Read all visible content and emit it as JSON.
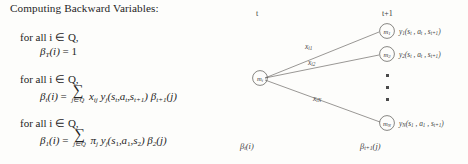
{
  "document": {
    "heading": "Computing Backward Variables:",
    "blocks": [
      {
        "quantifier": "for all i ∈ Q,",
        "equation_plain": "β_T(i) = 1",
        "lhs_beta": "β",
        "lhs_sub": "T",
        "lhs_arg": "(i)",
        "relation": "=",
        "rhs": "1",
        "has_sum": false
      },
      {
        "quantifier": "for all i ∈ Q,",
        "equation_plain": "β_t(i) = ∑_{j∈Q} x_ij y_j(s_t, a_t, s_{t+1}) β_{t+1}(j)",
        "lhs_beta": "β",
        "lhs_sub": "t",
        "lhs_arg": "(i)",
        "relation": "=",
        "has_sum": true,
        "sum_symbol": "∑",
        "sum_limit": "j∈Q",
        "transition_term": "x",
        "transition_sub": "ij",
        "emission_term": "y",
        "emission_sub": "j",
        "emission_args": "(s_t, a_t, s_{t+1})",
        "beta_term": "β",
        "beta_sub": "t+1",
        "beta_arg": "(j)"
      },
      {
        "quantifier": "for all i ∈ Q,",
        "equation_plain": "β_1(i) = ∑_{j∈Q} π_j y_j(s_1, a_1, s_2) β_2(j)",
        "lhs_beta": "β",
        "lhs_sub": "1",
        "lhs_arg": "(i)",
        "relation": "=",
        "has_sum": true,
        "sum_symbol": "∑",
        "sum_limit": "j∈Q",
        "transition_term": "π",
        "transition_sub": "j",
        "emission_term": "y",
        "emission_sub": "j",
        "emission_args": "(s_1, a_1, s_2)",
        "beta_term": "β",
        "beta_sub": "2",
        "beta_arg": "(j)"
      }
    ]
  },
  "diagram": {
    "time_labels": {
      "left": "t",
      "right": "t+1"
    },
    "source_node": {
      "label": "m",
      "sub": "i"
    },
    "target_nodes": [
      {
        "label": "m",
        "sub": "1",
        "emission": "y",
        "emission_sub": "1",
        "emission_args": "(s",
        "emission_args_full": "y₁(sₜ , aₜ , sₜ₊₁)"
      },
      {
        "label": "m",
        "sub": "2",
        "emission": "y",
        "emission_sub": "2",
        "emission_args_full": "y₂(sₜ , aₜ , sₜ₊₁)"
      },
      {
        "label": "m",
        "sub": "N",
        "emission": "y",
        "emission_sub": "N",
        "emission_args_full": "y_N(s₁ , a₁ , sₜ₊₁)"
      }
    ],
    "edge_labels": [
      {
        "term": "x",
        "sub": "i1"
      },
      {
        "term": "x",
        "sub": "i2"
      },
      {
        "term": "x",
        "sub": "iN"
      }
    ],
    "emission_arg_parts": {
      "s_first": "s",
      "s_first_sub": "t",
      "a": "a",
      "a_sub": "t",
      "s_next": "s",
      "s_next_sub": "t+1",
      "s_first_bottom": "s",
      "s_first_bottom_sub": "1",
      "a_bottom": "a",
      "a_bottom_sub": "1"
    },
    "beta_labels": [
      {
        "term": "β",
        "sub": "t",
        "arg": "(i)"
      },
      {
        "term": "β",
        "sub": "t+1",
        "arg": "(j)"
      }
    ],
    "vertical_ellipsis_count": 3,
    "colors": {
      "ink": "#3a3a3a",
      "paper": "#fdfdfb",
      "node_stroke": "#4a4a4a"
    }
  }
}
